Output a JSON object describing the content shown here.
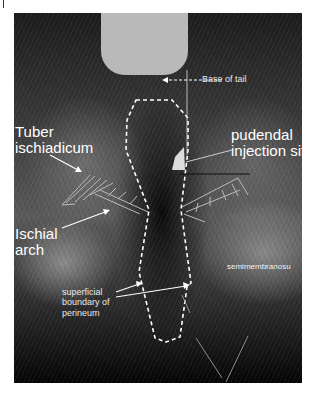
{
  "figure": {
    "colors": {
      "annotation": "#ffffff",
      "tail_block": "#b9b9b9",
      "background": "#ffffff"
    }
  },
  "labels": {
    "base_of_tail": "Base of tail",
    "tuber_line1": "Tuber",
    "tuber_line2": "ischiadicum",
    "pudendal_line1": "pudendal",
    "pudendal_line2": "injection sit",
    "ischial_line1": "Ischial",
    "ischial_line2": "arch",
    "semimembranosus": "semimembranosu",
    "perineum_line1": "superficial",
    "perineum_line2": "boundary of",
    "perineum_line3": "perineum"
  }
}
